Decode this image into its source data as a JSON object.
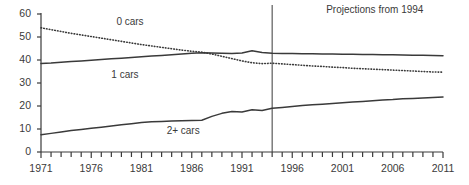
{
  "chart_data": {
    "type": "line",
    "title": "",
    "subtitle": "",
    "xlabel": "",
    "ylabel": "",
    "xlim": [
      1971,
      2011
    ],
    "ylim": [
      0,
      60
    ],
    "grid": false,
    "legend_position": "inline-labels",
    "y_ticks": [
      "0",
      "10",
      "20",
      "30",
      "40",
      "50",
      "60"
    ],
    "y_tick_values": [
      0,
      10,
      20,
      30,
      40,
      50,
      60
    ],
    "x_ticks": [
      "1971",
      "1976",
      "1981",
      "1986",
      "1991",
      "1996",
      "2001",
      "2006",
      "2011"
    ],
    "x_tick_values": [
      1971,
      1976,
      1981,
      1986,
      1991,
      1996,
      2001,
      2006,
      2011
    ],
    "x_minor_tick_step": 1,
    "annotations": [
      {
        "name": "projection-divider",
        "text": "Projections from 1994",
        "x_value": 1994,
        "type": "vertical-line-with-label"
      }
    ],
    "x": [
      1971,
      1972,
      1973,
      1974,
      1975,
      1976,
      1977,
      1978,
      1979,
      1980,
      1981,
      1982,
      1983,
      1984,
      1985,
      1986,
      1987,
      1988,
      1989,
      1990,
      1991,
      1992,
      1993,
      1994,
      1995,
      1996,
      1997,
      1998,
      1999,
      2000,
      2001,
      2002,
      2003,
      2004,
      2005,
      2006,
      2007,
      2008,
      2009,
      2010,
      2011
    ],
    "series": [
      {
        "name": "0 cars",
        "label": "0 cars",
        "style": "dotted",
        "color": "#3a3a3a",
        "label_x_value": 1978.5,
        "label_y_value": 56.5,
        "values": [
          54.0,
          53.2,
          52.4,
          51.6,
          50.9,
          50.2,
          49.5,
          48.8,
          48.1,
          47.4,
          46.7,
          46.1,
          45.5,
          44.9,
          44.3,
          43.8,
          43.4,
          42.6,
          41.6,
          40.6,
          39.6,
          38.8,
          38.4,
          38.6,
          38.3,
          38.0,
          37.7,
          37.4,
          37.2,
          36.9,
          36.7,
          36.4,
          36.2,
          36.0,
          35.8,
          35.6,
          35.4,
          35.2,
          35.0,
          34.8,
          34.7
        ]
      },
      {
        "name": "1 cars",
        "label": "1 cars",
        "style": "solid",
        "color": "#3a3a3a",
        "label_x_value": 1978.0,
        "label_y_value": 33.5,
        "values": [
          38.5,
          38.7,
          39.0,
          39.3,
          39.6,
          39.9,
          40.2,
          40.5,
          40.8,
          41.1,
          41.4,
          41.7,
          42.0,
          42.3,
          42.6,
          42.9,
          43.1,
          43.0,
          42.9,
          42.8,
          43.0,
          44.0,
          43.3,
          42.9,
          42.8,
          42.8,
          42.7,
          42.7,
          42.6,
          42.6,
          42.5,
          42.5,
          42.4,
          42.4,
          42.3,
          42.3,
          42.2,
          42.1,
          42.1,
          42.0,
          41.9
        ]
      },
      {
        "name": "2+ cars",
        "label": "2+ cars",
        "style": "solid",
        "color": "#3a3a3a",
        "label_x_value": 1983.5,
        "label_y_value": 9.0,
        "values": [
          7.5,
          8.1,
          8.7,
          9.3,
          9.8,
          10.3,
          10.8,
          11.3,
          11.8,
          12.3,
          12.8,
          13.1,
          13.3,
          13.5,
          13.6,
          13.7,
          13.8,
          15.5,
          16.8,
          17.6,
          17.4,
          18.4,
          18.0,
          19.0,
          19.4,
          19.8,
          20.2,
          20.5,
          20.8,
          21.1,
          21.4,
          21.7,
          22.0,
          22.3,
          22.6,
          22.8,
          23.1,
          23.3,
          23.5,
          23.7,
          23.9
        ]
      }
    ]
  }
}
